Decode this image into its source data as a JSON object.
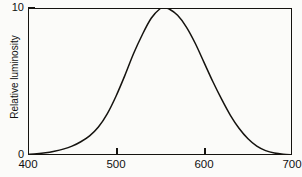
{
  "chart_data": {
    "type": "line",
    "title": "",
    "xlabel": "",
    "ylabel": "Relative luminosity",
    "xlim": [
      400,
      700
    ],
    "ylim": [
      0,
      10
    ],
    "grid": false,
    "legend": null,
    "x_ticks": [
      {
        "value": 400,
        "label": "400",
        "has_mark": false
      },
      {
        "value": 500,
        "label": "500",
        "has_mark": true
      },
      {
        "value": 600,
        "label": "600",
        "has_mark": true
      },
      {
        "value": 700,
        "label": "700",
        "has_mark": false
      }
    ],
    "y_ticks": [
      {
        "value": 0,
        "label": "0",
        "has_mark": false
      },
      {
        "value": 10,
        "label": "10",
        "has_mark": true
      }
    ],
    "series": [
      {
        "name": "photopic luminosity",
        "color": "#15130f",
        "x": [
          400,
          410,
          420,
          430,
          440,
          450,
          460,
          470,
          480,
          490,
          500,
          510,
          520,
          530,
          540,
          550,
          555,
          560,
          570,
          580,
          590,
          600,
          610,
          620,
          630,
          640,
          650,
          660,
          670,
          680,
          690,
          700
        ],
        "y": [
          0.04,
          0.08,
          0.15,
          0.26,
          0.4,
          0.6,
          0.9,
          1.3,
          1.9,
          2.8,
          4.0,
          5.4,
          6.9,
          8.2,
          9.3,
          9.95,
          10.0,
          9.95,
          9.5,
          8.7,
          7.6,
          6.3,
          5.0,
          3.8,
          2.7,
          1.8,
          1.1,
          0.6,
          0.3,
          0.13,
          0.05,
          0.02
        ]
      }
    ],
    "peak": {
      "x": 555,
      "y": 10
    },
    "axis_color": "#15130f",
    "background_color": "#fbfbf9"
  }
}
